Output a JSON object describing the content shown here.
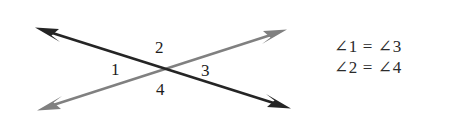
{
  "figure": {
    "background_color": "#ffffff"
  },
  "diagram": {
    "intersection": {
      "x": 165,
      "y": 70
    },
    "lines": [
      {
        "name": "dark-line",
        "color": "#252525",
        "stroke_width": 2.6,
        "from": {
          "x": 290,
          "y": 108
        },
        "to": {
          "x": 36,
          "y": 28
        },
        "arrow_start": true,
        "arrow_end": true
      },
      {
        "name": "gray-line",
        "color": "#808080",
        "stroke_width": 2.4,
        "from": {
          "x": 38,
          "y": 110
        },
        "to": {
          "x": 286,
          "y": 30
        },
        "arrow_start": true,
        "arrow_end": true
      }
    ],
    "angle_labels": [
      {
        "id": "1",
        "text": "1",
        "position": "left",
        "x": 117,
        "y": 70
      },
      {
        "id": "2",
        "text": "2",
        "position": "top",
        "x": 161,
        "y": 48
      },
      {
        "id": "3",
        "text": "3",
        "position": "right",
        "x": 207,
        "y": 71
      },
      {
        "id": "4",
        "text": "4",
        "position": "bottom",
        "x": 162,
        "y": 90
      }
    ]
  },
  "equations": {
    "line1": "∠1 = ∠3",
    "line2": "∠2 = ∠4"
  },
  "colors": {
    "dark_line": "#252525",
    "gray_line": "#808080",
    "text": "#1c1c1c",
    "background": "#ffffff"
  }
}
